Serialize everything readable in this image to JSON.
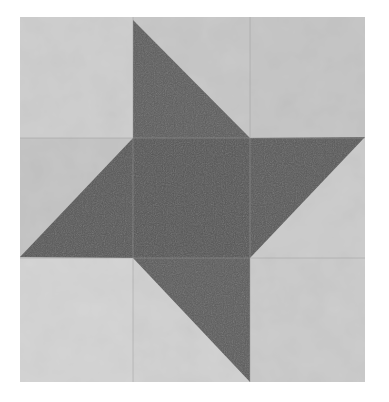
{
  "image": {
    "subject": "Quilt block with pinwheel star pattern",
    "alt": "Grayscale photo of a nine-patch quilt block: a dark center square with four dark triangles forming a pinwheel star on a light mottled background"
  },
  "palette": {
    "background": "#ffffff",
    "light_fabric": "#c9c9c9",
    "light_fabric_alt": "#d2d2d2",
    "light_fabric_alt2": "#bfbfbf",
    "dark_fabric": "#5a5a5a",
    "dark_fabric_center": "#555555",
    "seam": "#a8a8a8"
  },
  "geometry": {
    "block": {
      "x1": 20,
      "y1": 17,
      "x2": 365,
      "y2": 382
    },
    "cols": [
      20,
      133,
      250,
      365
    ],
    "rows": [
      17,
      138,
      258,
      382
    ],
    "triangles": [
      {
        "name": "top",
        "points": "133,20 250,138 133,138"
      },
      {
        "name": "right",
        "points": "250,138 365,137 250,258"
      },
      {
        "name": "bottom",
        "points": "133,258 250,258 250,382"
      },
      {
        "name": "left",
        "points": "20,257 133,138 133,258"
      }
    ]
  }
}
